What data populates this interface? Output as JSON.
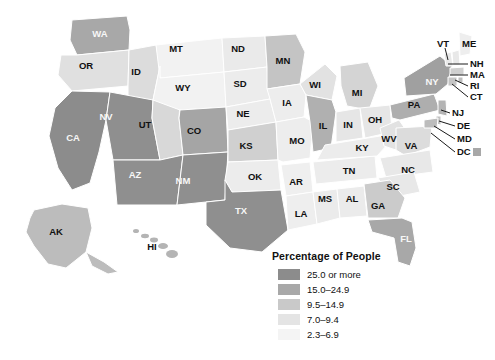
{
  "map": {
    "title": "",
    "projection_note": "",
    "background_color": "#ffffff",
    "border_color": "#ffffff",
    "legend": {
      "title": "Percentage of People",
      "entries": [
        {
          "label": "25.0 or more",
          "color": "#8c8c8c",
          "min": 25.0,
          "max": null
        },
        {
          "label": "15.0–24.9",
          "color": "#a8a8a8",
          "min": 15.0,
          "max": 24.9
        },
        {
          "label": "9.5–14.9",
          "color": "#c9c9c9",
          "min": 9.5,
          "max": 14.9
        },
        {
          "label": "7.0–9.4",
          "color": "#e4e4e4",
          "min": 7.0,
          "max": 9.4
        },
        {
          "label": "2.3–6.9",
          "color": "#f4f4f4",
          "min": 2.3,
          "max": 6.9
        }
      ]
    },
    "dc_chip_color": "#a8a8a8",
    "states": [
      {
        "abbr": "WA",
        "color": "#a8a8a8",
        "bin": 1,
        "label_x": 100,
        "label_y": 34,
        "label_tone": "ondark"
      },
      {
        "abbr": "OR",
        "color": "#e0e0e0",
        "bin": 3,
        "label_x": 86,
        "label_y": 66,
        "label_tone": "onlight"
      },
      {
        "abbr": "ID",
        "color": "#dcdcdc",
        "bin": 3,
        "label_x": 136,
        "label_y": 72,
        "label_tone": "onlight"
      },
      {
        "abbr": "MT",
        "color": "#f2f2f2",
        "bin": 4,
        "label_x": 176,
        "label_y": 49,
        "label_tone": "onlight"
      },
      {
        "abbr": "WY",
        "color": "#f2f2f2",
        "bin": 4,
        "label_x": 183,
        "label_y": 88,
        "label_tone": "onlight"
      },
      {
        "abbr": "ND",
        "color": "#eaeaea",
        "bin": 4,
        "label_x": 238,
        "label_y": 49,
        "label_tone": "onlight"
      },
      {
        "abbr": "SD",
        "color": "#ececec",
        "bin": 4,
        "label_x": 240,
        "label_y": 84,
        "label_tone": "onlight"
      },
      {
        "abbr": "NE",
        "color": "#ececec",
        "bin": 4,
        "label_x": 243,
        "label_y": 114,
        "label_tone": "onlight"
      },
      {
        "abbr": "MN",
        "color": "#c4c4c4",
        "bin": 2,
        "label_x": 283,
        "label_y": 61,
        "label_tone": "onlight"
      },
      {
        "abbr": "IA",
        "color": "#ededed",
        "bin": 4,
        "label_x": 287,
        "label_y": 103,
        "label_tone": "onlight"
      },
      {
        "abbr": "WI",
        "color": "#e2e2e2",
        "bin": 3,
        "label_x": 315,
        "label_y": 85,
        "label_tone": "onlight"
      },
      {
        "abbr": "MI",
        "color": "#d4d4d4",
        "bin": 2,
        "label_x": 357,
        "label_y": 93,
        "label_tone": "onlight"
      },
      {
        "abbr": "NV",
        "color": "#8f8f8f",
        "bin": 0,
        "label_x": 106,
        "label_y": 117,
        "label_tone": "ondark"
      },
      {
        "abbr": "UT",
        "color": "#d8d8d8",
        "bin": 2,
        "label_x": 145,
        "label_y": 125,
        "label_tone": "onlight"
      },
      {
        "abbr": "CO",
        "color": "#a5a5a5",
        "bin": 1,
        "label_x": 194,
        "label_y": 131,
        "label_tone": "onlight"
      },
      {
        "abbr": "KS",
        "color": "#d0d0d0",
        "bin": 2,
        "label_x": 246,
        "label_y": 146,
        "label_tone": "onlight"
      },
      {
        "abbr": "MO",
        "color": "#ededed",
        "bin": 4,
        "label_x": 297,
        "label_y": 141,
        "label_tone": "onlight"
      },
      {
        "abbr": "IL",
        "color": "#b0b0b0",
        "bin": 1,
        "label_x": 323,
        "label_y": 126,
        "label_tone": "onlight"
      },
      {
        "abbr": "IN",
        "color": "#e6e6e6",
        "bin": 4,
        "label_x": 348,
        "label_y": 125,
        "label_tone": "onlight"
      },
      {
        "abbr": "OH",
        "color": "#e6e6e6",
        "bin": 4,
        "label_x": 375,
        "label_y": 120,
        "label_tone": "onlight"
      },
      {
        "abbr": "CA",
        "color": "#8c8c8c",
        "bin": 0,
        "label_x": 73,
        "label_y": 138,
        "label_tone": "ondark"
      },
      {
        "abbr": "AZ",
        "color": "#8f8f8f",
        "bin": 0,
        "label_x": 135,
        "label_y": 175,
        "label_tone": "ondark"
      },
      {
        "abbr": "NM",
        "color": "#8f8f8f",
        "bin": 0,
        "label_x": 183,
        "label_y": 181,
        "label_tone": "ondark"
      },
      {
        "abbr": "OK",
        "color": "#ececec",
        "bin": 4,
        "label_x": 255,
        "label_y": 177,
        "label_tone": "onlight"
      },
      {
        "abbr": "AR",
        "color": "#efefef",
        "bin": 4,
        "label_x": 296,
        "label_y": 182,
        "label_tone": "onlight"
      },
      {
        "abbr": "TX",
        "color": "#8f8f8f",
        "bin": 0,
        "label_x": 241,
        "label_y": 211,
        "label_tone": "ondark"
      },
      {
        "abbr": "LA",
        "color": "#eeeeee",
        "bin": 4,
        "label_x": 301,
        "label_y": 214,
        "label_tone": "onlight"
      },
      {
        "abbr": "MS",
        "color": "#ebebeb",
        "bin": 4,
        "label_x": 325,
        "label_y": 199,
        "label_tone": "onlight"
      },
      {
        "abbr": "AL",
        "color": "#ebebeb",
        "bin": 4,
        "label_x": 352,
        "label_y": 199,
        "label_tone": "onlight"
      },
      {
        "abbr": "TN",
        "color": "#ececec",
        "bin": 4,
        "label_x": 349,
        "label_y": 171,
        "label_tone": "onlight"
      },
      {
        "abbr": "KY",
        "color": "#ececec",
        "bin": 4,
        "label_x": 362,
        "label_y": 148,
        "label_tone": "onlight"
      },
      {
        "abbr": "WV",
        "color": "#e2e2e2",
        "bin": 3,
        "label_x": 389,
        "label_y": 139,
        "label_tone": "onlight"
      },
      {
        "abbr": "VA",
        "color": "#dcdcdc",
        "bin": 3,
        "label_x": 411,
        "label_y": 146,
        "label_tone": "onlight"
      },
      {
        "abbr": "NC",
        "color": "#e8e8e8",
        "bin": 4,
        "label_x": 408,
        "label_y": 170,
        "label_tone": "onlight"
      },
      {
        "abbr": "SC",
        "color": "#e8e8e8",
        "bin": 4,
        "label_x": 393,
        "label_y": 187,
        "label_tone": "onlight"
      },
      {
        "abbr": "GA",
        "color": "#cbcbcb",
        "bin": 2,
        "label_x": 378,
        "label_y": 206,
        "label_tone": "onlight"
      },
      {
        "abbr": "FL",
        "color": "#a8a8a8",
        "bin": 1,
        "label_x": 406,
        "label_y": 239,
        "label_tone": "ondark"
      },
      {
        "abbr": "PA",
        "color": "#aeaeae",
        "bin": 1,
        "label_x": 414,
        "label_y": 105,
        "label_tone": "onlight"
      },
      {
        "abbr": "NY",
        "color": "#a0a0a0",
        "bin": 1,
        "label_x": 432,
        "label_y": 82,
        "label_tone": "ondark"
      },
      {
        "abbr": "AK",
        "color": "#bcbcbc",
        "bin": 2,
        "label_x": 56,
        "label_y": 232,
        "label_tone": "onlight"
      },
      {
        "abbr": "HI",
        "color": "#b4b4b4",
        "bin": 2,
        "label_x": 152,
        "label_y": 247,
        "label_tone": "onlight"
      }
    ],
    "leader_labels": [
      {
        "abbr": "VT",
        "x": 437,
        "y": 44,
        "line": "M445,48 L448,60"
      },
      {
        "abbr": "ME",
        "x": 462,
        "y": 44,
        "line": ""
      },
      {
        "abbr": "NH",
        "x": 470,
        "y": 64,
        "line": "M448,64 L468,64"
      },
      {
        "abbr": "MA",
        "x": 470,
        "y": 75,
        "line": "M450,75 L468,75"
      },
      {
        "abbr": "RI",
        "x": 470,
        "y": 86,
        "line": "M455,80 L468,86"
      },
      {
        "abbr": "CT",
        "x": 470,
        "y": 97,
        "line": "M452,84 L468,97"
      },
      {
        "abbr": "NJ",
        "x": 452,
        "y": 113,
        "line": "M441,110 L450,113"
      },
      {
        "abbr": "DE",
        "x": 457,
        "y": 126,
        "line": "M439,121 L455,126"
      },
      {
        "abbr": "MD",
        "x": 457,
        "y": 139,
        "line": "M434,126 L455,139"
      },
      {
        "abbr": "DC",
        "x": 457,
        "y": 152,
        "line": "M431,133 L455,152"
      }
    ]
  }
}
